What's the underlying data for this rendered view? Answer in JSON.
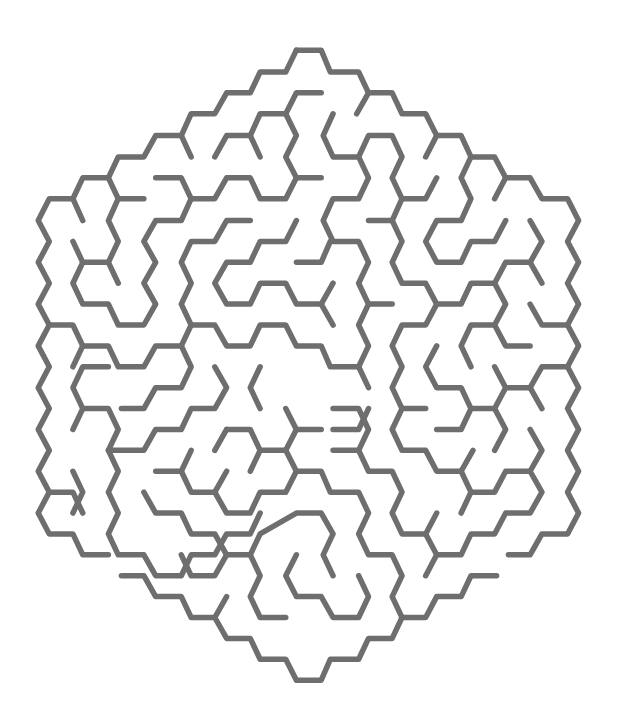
{
  "image": {
    "kind": "hexagonal-maze",
    "background": "#ffffff",
    "wall_color": "#6e6e6e"
  },
  "maze": {
    "shape": "hexagon",
    "openings": [
      "left-bottom-edge",
      "right-bottom-edge"
    ],
    "walls": [
      "M752,108 L815,108 L838,155 L910,155 L935,200 L995,200 L1020,245 L1080,245 L1108,292 L1170,292 L1195,338 L1255,338 L1283,383 L1345,383 L1375,428 L1440,428 L1468,475 L1440,520 L1468,565 L1440,610 L1468,655 L1440,700 L1468,745 L1440,790 L1468,835 L1440,880 L1468,925 L1440,970 L1468,1015 L1440,1060 L1468,1105 L1440,1150 L1375,1150 L1345,1195 L1290,1195",
      "M752,108 L725,155 L660,155 L635,200 L575,200 L545,245 L485,245 L460,292 L395,292 L365,338 L300,338 L275,383 L210,383 L185,428 L125,428 L97,475 L125,520 L97,565 L125,610 L97,655 L125,700 L97,745 L125,790 L97,835 L125,880 L97,925 L125,970 L97,1015 L125,1060 L97,1105 L125,1150 L185,1150 L210,1195 L275,1195",
      "M308,1240 L365,1240 L395,1285 L460,1285 L485,1330 L545,1330 L575,1375 L635,1375 L660,1420 L725,1420 L752,1465 L815,1465 L838,1420 L910,1420 L935,1375 L995,1375 L1020,1330 L1080,1330 L1108,1285 L1170,1285 L1195,1240 L1260,1240",
      "M935,200 L905,245",
      "M460,292 L485,338",
      "M815,200 L752,200 L725,245 L660,245 L635,292 L575,292 L545,338",
      "M635,292 L660,338",
      "M725,245 L752,292 L725,338 L752,383 L815,383",
      "M752,383 L725,428 L660,428 L635,383 L575,383 L545,428 L485,428 L460,383 L395,383",
      "M845,245 L820,292 L845,338 L910,338 L935,383 L910,428 L845,428 L820,475 L845,520 L910,520 L935,565 L910,610 L935,655 L910,700 L935,745 L910,790 L935,835",
      "M910,338 L935,292 L995,292 L1020,338 L995,383 L1020,428 L1080,428 L1108,383",
      "M1020,428 L995,475 L935,475",
      "M995,475 L1020,520 L995,565 L1020,610 L1080,610 L1108,655 L1170,655 L1195,610 L1255,610 L1283,565 L1345,565 L1375,520 L1345,475",
      "M1345,565 L1375,610",
      "M1108,292 L1080,338",
      "M1195,338 L1170,383 L1195,428 L1170,475 L1108,475 L1080,520 L1108,565 L1170,565 L1195,520 L1255,520 L1283,475",
      "M1283,383 L1255,428",
      "M275,383 L300,428 L365,428",
      "M300,428 L275,475 L300,520 L275,565 L300,610",
      "M185,428 L210,475",
      "M185,520 L210,565 L275,565",
      "M210,565 L185,610 L210,655 L275,655 L300,700 L365,700 L395,655 L365,610 L395,565 L365,520 L395,475 L460,475 L485,428",
      "M635,475 L575,475 L545,520 L485,520 L460,565 L485,610 L460,655 L485,700 L545,700 L575,745 L635,745 L660,700 L725,700 L752,745 L815,745 L838,790 L910,790",
      "M485,700 L460,745 L395,745 L365,790 L300,790 L275,745 L210,745 L185,700 L125,700",
      "M210,745 L185,790",
      "M460,745 L485,790 L460,835 L395,835 L365,880 L308,880",
      "M752,565 L815,565 L838,520",
      "M752,475 L725,520 L660,520 L635,565 L575,565 L545,610 L575,655 L635,655 L660,610 L725,610 L752,655 L815,655 L845,610",
      "M815,655 L845,700",
      "M935,655 L995,655",
      "M1108,655 L1080,700 L1020,700 L995,745 L1020,790 L995,835 L1020,880 L995,925 L1020,970 L1080,970 L1108,1015 L1170,1015",
      "M1255,610 L1283,655 L1255,700 L1283,745 L1345,745",
      "M1345,655 L1375,700 L1440,700",
      "M1255,700 L1195,700 L1170,745 L1195,790",
      "M1108,745 L1080,790 L1108,835 L1170,835 L1195,880 L1170,925 L1108,925",
      "M1195,880 L1255,880 L1283,835 L1345,835 L1375,790 L1440,790",
      "M1255,790 L1283,835",
      "M1345,835 L1375,880",
      "M1020,880 L1080,880",
      "M1255,880 L1283,925 L1255,970",
      "M1345,925 L1375,970 L1345,1015 L1375,1060 L1345,1105 L1283,1105 L1255,1150 L1195,1150 L1170,1195 L1108,1195 L1080,1150 L1020,1150 L995,1105 L1020,1060 L995,1015 L935,1015 L910,970 L845,970",
      "M1345,1015 L1283,1015 L1255,1060 L1195,1060 L1170,1105",
      "M1195,1060 L1170,1015",
      "M1200,970 L1170,1015",
      "M1108,1105 L1080,1150",
      "M1108,1195 L1080,1240",
      "M545,790 L575,835 L545,880 L485,880 L460,925 L395,925 L365,970 L275,970 L300,925 L275,880 L210,880 L185,835 L210,790 L275,790",
      "M210,880 L185,925",
      "M660,790 L635,835 L660,880",
      "M725,880 L752,925 L815,925",
      "M752,925 L725,970",
      "M575,925 L545,970",
      "M575,925 L635,925 L660,970 L725,970",
      "M660,970 L635,1015",
      "M485,970 L460,1015 L395,1015",
      "M460,1015 L485,1060 L545,1060 L575,1105 L635,1105 L660,1060 L725,1060 L752,1015 L815,1015 L838,1060 L910,1060 L935,1105 L910,1150 L935,1195 L995,1195 L1020,1240 L995,1285 L1020,1330",
      "M575,1015 L545,1060",
      "M752,1015 L725,970",
      "M275,970 L300,1015 L275,1060 L300,1105 L275,1150 L300,1195 L365,1195 L395,1240 L460,1240 L485,1195 L545,1195 L575,1150 L635,1150 L660,1105",
      "M365,1060 L395,1105 L460,1105 L485,1150 L545,1150 L575,1195 L635,1195",
      "M575,1195 L545,1240 L485,1240 L460,1195",
      "M635,1195 L660,1240 L635,1285 L660,1330 L725,1330",
      "M635,1195 L660,1150 L752,1105 L815,1105 L845,1150 L820,1195 L845,1240",
      "M752,1195 L725,1240 L752,1285 L815,1285 L845,1330 L910,1330 L935,1285 L910,1240",
      "M575,1285 L545,1330",
      "M935,880 L910,925 L845,925? ",
      "M845,880 L910,880 L935,925 L910,970",
      "M185,1015 L210,1060 L185,1105",
      "M125,1060 L185,1060 L210,1105"
    ]
  }
}
